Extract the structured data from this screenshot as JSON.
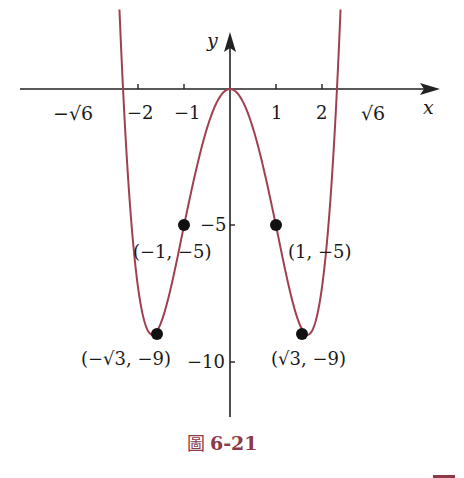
{
  "chart_data": {
    "type": "line",
    "function": "y = x^4 - 6x^2",
    "title": "",
    "caption": "圖 6-21",
    "xlabel": "x",
    "ylabel": "y",
    "x_ticks": [
      -2,
      -1,
      1,
      2
    ],
    "x_tick_labels": [
      "−√6",
      "−2",
      "−1",
      "1",
      "2",
      "√6"
    ],
    "y_ticks": [
      -5,
      -10
    ],
    "y_tick_labels": [
      "−5",
      "−10"
    ],
    "xlim": [
      -4.6,
      4.6
    ],
    "ylim": [
      -12,
      1.3
    ],
    "grid": false,
    "legend": null,
    "series": [
      {
        "name": "f(x) = x^4 - 6x^2",
        "color": "#a0404f",
        "x": [
          -2.55,
          -2.449,
          -2,
          -1.732,
          -1,
          0,
          1,
          1.732,
          2,
          2.449,
          2.55
        ],
        "y": [
          1.26,
          0,
          -8,
          -9,
          -5,
          0,
          -5,
          -9,
          -8,
          0,
          1.26
        ]
      }
    ],
    "annotations": [
      {
        "point": [
          -1,
          -5
        ],
        "label": "(−1, −5)"
      },
      {
        "point": [
          1,
          -5
        ],
        "label": "(1, −5)"
      },
      {
        "point": [
          -1.732,
          -9
        ],
        "label": "(−√3, −9)"
      },
      {
        "point": [
          1.732,
          -9
        ],
        "label": "(√3, −9)"
      }
    ],
    "x_intercepts": [
      "−√6",
      "0",
      "√6"
    ]
  },
  "labels": {
    "x_axis": "x",
    "y_axis": "y",
    "neg_sqrt6": "−√6",
    "neg2": "−2",
    "neg1": "−1",
    "pos1": "1",
    "pos2": "2",
    "sqrt6": "√6",
    "y_neg5": "−5",
    "y_neg10": "−10",
    "pt_neg1": "(−1, −5)",
    "pt_pos1": "(1, −5)",
    "pt_negsqrt3": "(−√3, −9)",
    "pt_sqrt3": "(√3, −9)"
  },
  "caption": {
    "glyph": "圖",
    "number": "6-21"
  },
  "colors": {
    "curve": "#a0404f",
    "axis": "#222222",
    "point": "#111111",
    "caption": "#8a3a48"
  }
}
